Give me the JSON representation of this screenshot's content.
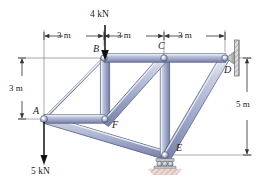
{
  "figure": {
    "type": "truss-free-body-diagram"
  },
  "nodes": [
    {
      "id": "A",
      "label": "A",
      "x": 44,
      "y": 119,
      "joint": "pin-gusset"
    },
    {
      "id": "B",
      "label": "B",
      "x": 104,
      "y": 58,
      "joint": "pin-gusset"
    },
    {
      "id": "C",
      "label": "C",
      "x": 164,
      "y": 58,
      "joint": "pin-gusset"
    },
    {
      "id": "D",
      "label": "D",
      "x": 225,
      "y": 58,
      "joint": "wall-pin-support"
    },
    {
      "id": "E",
      "label": "E",
      "x": 165,
      "y": 155,
      "joint": "roller-support"
    },
    {
      "id": "F",
      "label": "F",
      "x": 105,
      "y": 119,
      "joint": "pin-gusset"
    }
  ],
  "members": [
    {
      "from": "A",
      "to": "B"
    },
    {
      "from": "B",
      "to": "C"
    },
    {
      "from": "C",
      "to": "D"
    },
    {
      "from": "A",
      "to": "F"
    },
    {
      "from": "B",
      "to": "F"
    },
    {
      "from": "F",
      "to": "C"
    },
    {
      "from": "A",
      "to": "E"
    },
    {
      "from": "C",
      "to": "E"
    },
    {
      "from": "E",
      "to": "D"
    }
  ],
  "loads": [
    {
      "id": "load-at-B",
      "label": "4 kN",
      "magnitude": 4,
      "unit": "kN",
      "at": "B",
      "direction": "down"
    },
    {
      "id": "load-at-A",
      "label": "5 kN",
      "magnitude": 5,
      "unit": "kN",
      "at": "A",
      "direction": "down"
    }
  ],
  "dimensions": [
    {
      "id": "top-span-1",
      "label": "3 m",
      "value": 3,
      "unit": "m",
      "orientation": "horizontal",
      "from": "A",
      "to": "B"
    },
    {
      "id": "top-span-2",
      "label": "3 m",
      "value": 3,
      "unit": "m",
      "orientation": "horizontal",
      "from": "B",
      "to": "C"
    },
    {
      "id": "top-span-3",
      "label": "3 m",
      "value": 3,
      "unit": "m",
      "orientation": "horizontal",
      "from": "C",
      "to": "D"
    },
    {
      "id": "left-height",
      "label": "3 m",
      "value": 3,
      "unit": "m",
      "orientation": "vertical",
      "from": "B",
      "to": "A"
    },
    {
      "id": "right-height",
      "label": "5 m",
      "value": 5,
      "unit": "m",
      "orientation": "vertical",
      "from": "D",
      "to": "E"
    }
  ],
  "supports": [
    {
      "id": "support-D",
      "type": "pin-wall",
      "at": "D"
    },
    {
      "id": "support-E",
      "type": "roller",
      "at": "E"
    }
  ],
  "colors": {
    "member_light": "#d8dcec",
    "member_mid": "#9aa3c4",
    "member_dark": "#6d779f",
    "outline": "#4a5070",
    "dimension_line": "#3a3a3a",
    "load_arrow": "#111111",
    "support_gray": "#b8b8b8",
    "hatch": "#c9a9a0",
    "text": "#1a1a1a"
  }
}
